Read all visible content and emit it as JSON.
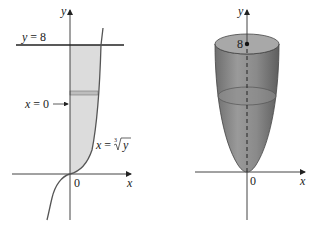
{
  "figure_left": {
    "title": "Region bounded by x = cube root of y, x = 0, y = 8",
    "axis_y_label": "y",
    "axis_x_label": "x",
    "origin_label": "0",
    "line_label": "y = 8",
    "line_label_var": "y",
    "line_label_val": "= 8",
    "boundary_label_var": "x",
    "boundary_label_val": "= 0",
    "curve_label_var": "x",
    "curve_label_eq": "=",
    "curve_label_index": "3",
    "curve_label_radicand": "y",
    "colors": {
      "region_fill": "#d9d9d9",
      "strip": "#9a9a9a",
      "line": "#333333"
    }
  },
  "figure_right": {
    "title": "Solid of revolution about the y-axis",
    "axis_y_label": "y",
    "axis_x_label": "x",
    "origin_label": "0",
    "top_point_label": "8",
    "colors": {
      "solid_fill": "#8c8c8c",
      "top_fill": "#a6a6a6",
      "line": "#333333"
    }
  }
}
